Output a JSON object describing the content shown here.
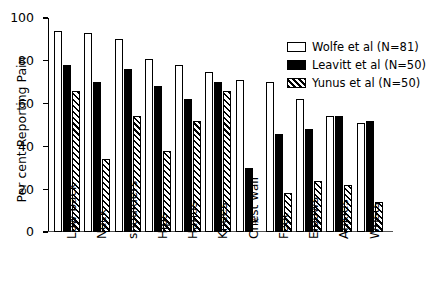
{
  "chart_data": {
    "type": "bar",
    "title": "",
    "xlabel": "",
    "ylabel": "Per cent Reporting Pain",
    "ylim": [
      0,
      100
    ],
    "yticks": [
      0,
      20,
      40,
      60,
      80,
      100
    ],
    "grid": false,
    "legend_position": "top-right",
    "categories": [
      "Low back",
      "Neck",
      "shoulders",
      "Hips",
      "Hands",
      "Knees",
      "Chest wall",
      "Feet",
      "Elbows",
      "Ankles",
      "Wrists"
    ],
    "series": [
      {
        "name": "Wolfe et al (N=81)",
        "style": "open",
        "values": [
          94,
          93,
          90,
          81,
          78,
          75,
          71,
          70,
          62,
          54,
          51
        ]
      },
      {
        "name": "Leavitt et al (N=50)",
        "style": "solid",
        "values": [
          78,
          70,
          76,
          68,
          62,
          70,
          30,
          46,
          48,
          54,
          52
        ]
      },
      {
        "name": "Yunus et al (N=50)",
        "style": "hatched",
        "values": [
          66,
          34,
          54,
          38,
          52,
          66,
          null,
          18,
          24,
          22,
          14
        ]
      }
    ],
    "annotations": [
      {
        "text": "*",
        "category": "Chest wall",
        "series": "Yunus et al (N=50)",
        "note": "no value reported"
      }
    ]
  },
  "legend": {
    "items": [
      {
        "label": "Wolfe et al (N=81)"
      },
      {
        "label": "Leavitt et al (N=50)"
      },
      {
        "label": "Yunus et al (N=50)"
      }
    ]
  },
  "axes": {
    "y_title": "Per cent Reporting Pain",
    "y_tick_labels": [
      "0",
      "20",
      "40",
      "60",
      "80",
      "100"
    ]
  }
}
